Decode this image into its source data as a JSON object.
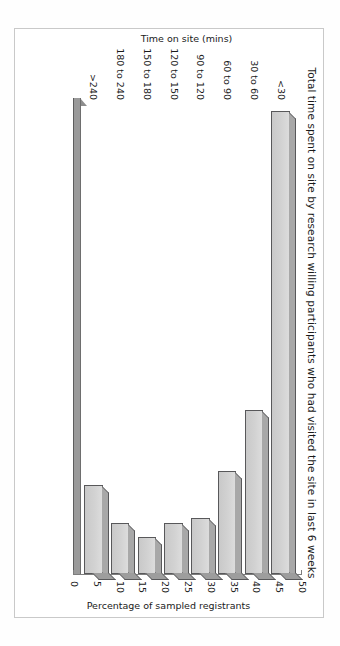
{
  "chart_data": {
    "type": "bar",
    "orientation": "vertical-rendered-rotated",
    "title": "Total time spent on site by research willing participants who had visited the site in last 6 weeks",
    "xlabel": "Time on site (mins)",
    "ylabel": "Percentage of sampled registrants",
    "categories": [
      "<30",
      "30 to 60",
      "60 to 90",
      "90 to 120",
      "120 to 150",
      "150 to 180",
      "180 to 240",
      ">240"
    ],
    "values": [
      49.5,
      17.5,
      11,
      6,
      5.5,
      4,
      5.5,
      9.5
    ],
    "ylim": [
      0,
      50
    ],
    "yticks": [
      0,
      5,
      10,
      15,
      20,
      25,
      30,
      35,
      40,
      45,
      50
    ],
    "ytick_labels": [
      "0",
      "5",
      "10",
      "15",
      "20",
      "25",
      "30",
      "35",
      "40",
      "45",
      "50"
    ],
    "grid": false,
    "legend": false,
    "style": {
      "bar_fill": "#d4d4d4",
      "bar_top": "#a8a8a8",
      "bar_side": "#9d9d9d",
      "bar_outline": "#58585a",
      "axis_color": "#7d7d7d",
      "floor_color": "#9a9a9a",
      "text_color": "#1a1a1a",
      "frame_color": "#c9c9c9",
      "background": "#ffffff"
    }
  }
}
